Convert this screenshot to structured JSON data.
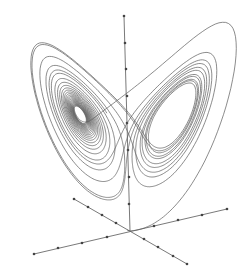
{
  "figure": {
    "type": "3d-trajectory-plot",
    "background": "#ffffff",
    "line_color": "#5a5a5a",
    "axis_color": "#6a6a6a",
    "tick_color": "#444444"
  },
  "attractor": {
    "sigma": 10,
    "rho": 28,
    "beta": 2.6667,
    "start": [
      0.1,
      0.0,
      0.5
    ],
    "dt": 0.005,
    "steps": 5200,
    "projection": {
      "origin_x": 127,
      "origin_y": 232,
      "kx": 5.3,
      "ky": 0.9,
      "kz": 4.35
    }
  },
  "axes": [
    {
      "name": "vertical-axis",
      "from": [
        130,
        231
      ],
      "to": [
        124,
        16
      ],
      "ticks": [
        [
          124,
          16
        ],
        [
          125,
          43
        ],
        [
          126,
          69
        ],
        [
          127,
          96
        ],
        [
          127,
          123
        ],
        [
          128,
          150
        ],
        [
          129,
          177
        ],
        [
          129,
          204
        ]
      ]
    },
    {
      "name": "axis-a",
      "from": [
        34,
        254
      ],
      "to": [
        227,
        209
      ],
      "ticks": [
        [
          34,
          254
        ],
        [
          58,
          248
        ],
        [
          82,
          243
        ],
        [
          107,
          237
        ],
        [
          154,
          226
        ],
        [
          178,
          220
        ],
        [
          202,
          215
        ],
        [
          227,
          209
        ]
      ]
    },
    {
      "name": "axis-b",
      "from": [
        74,
        199
      ],
      "to": [
        187,
        264
      ],
      "ticks": [
        [
          74,
          199
        ],
        [
          88,
          207
        ],
        [
          102,
          215
        ],
        [
          116,
          223
        ],
        [
          144,
          239
        ],
        [
          158,
          247
        ],
        [
          173,
          256
        ],
        [
          187,
          264
        ]
      ]
    }
  ]
}
